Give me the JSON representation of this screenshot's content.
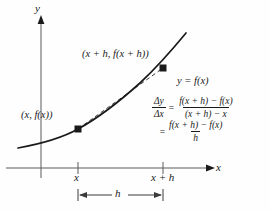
{
  "figure": {
    "name": "difference-quotient-secant-diagram",
    "background_color": "#fefefe",
    "ink_color": "#1a1a1a"
  },
  "axes": {
    "y_label": "y",
    "x_label": "x",
    "x_axis_y_px": 168,
    "y_axis_x_px": 41,
    "ticks": [
      {
        "label": "x",
        "x_px": 78
      },
      {
        "label": "x + h",
        "x_px": 163
      }
    ]
  },
  "curve": {
    "label": "y = f(x)",
    "style": "solid",
    "description": "increasing convex curve"
  },
  "secant": {
    "style": "dashed",
    "from_point": "lower-point",
    "to_point": "upper-point"
  },
  "points": [
    {
      "name": "lower-point",
      "label": "(x, f(x))",
      "x_px": 78,
      "y_px": 129
    },
    {
      "name": "upper-point",
      "label": "(x + h, f(x + h))",
      "x_px": 163,
      "y_px": 68
    }
  ],
  "measure": {
    "label": "h",
    "from_x_px": 78,
    "to_x_px": 163,
    "y_px": 195
  },
  "equations": {
    "line1": {
      "lhs_num": "Δy",
      "lhs_den": "Δx",
      "operator": "=",
      "rhs_num": "f(x + h) − f(x)",
      "rhs_den": "(x + h) − x"
    },
    "line2": {
      "operator": "=",
      "rhs_num": "f(x + h) − f(x)",
      "rhs_den": "h"
    }
  }
}
